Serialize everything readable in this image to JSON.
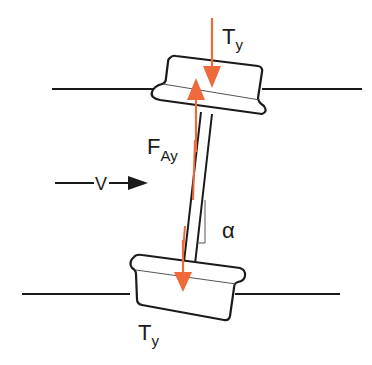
{
  "diagram": {
    "type": "mechanical free-body diagram",
    "colors": {
      "line": "#1a1a1a",
      "force": "#ee6a3a"
    },
    "labels": {
      "top_force": {
        "main": "T",
        "sub": "y"
      },
      "axial_force": {
        "main": "F",
        "sub": "Ay"
      },
      "velocity": "V",
      "angle": "α",
      "bottom_force": {
        "main": "T",
        "sub": "y"
      }
    }
  }
}
